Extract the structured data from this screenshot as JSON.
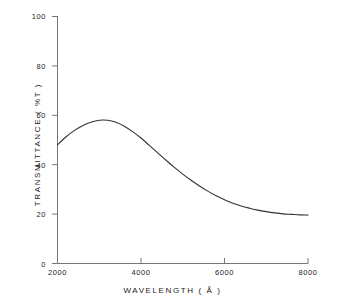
{
  "chart_data": {
    "type": "line",
    "title": "",
    "subtitle": "",
    "xlabel": "WAVELENGTH  ( Å )",
    "ylabel": "TRANSMITTANCE ( %T )",
    "xlim": [
      2000,
      8000
    ],
    "ylim": [
      0,
      100
    ],
    "grid": false,
    "legend": null,
    "xticks": [
      2000,
      4000,
      6000,
      8000
    ],
    "xtick_labels": [
      "2000",
      "4000",
      "6000",
      "8000"
    ],
    "yticks": [
      0,
      20,
      40,
      60,
      80,
      100
    ],
    "ytick_labels": [
      "0",
      "20",
      "40",
      "60",
      "80",
      "100"
    ],
    "series": [
      {
        "name": "transmittance",
        "color": "#333333",
        "x": [
          2000,
          2200,
          2400,
          2600,
          2800,
          3000,
          3200,
          3400,
          3600,
          3800,
          4000,
          4200,
          4400,
          4600,
          4800,
          5000,
          5200,
          5400,
          5600,
          5800,
          6000,
          6200,
          6400,
          6600,
          6800,
          7000,
          7200,
          7400,
          7600,
          7800,
          8000
        ],
        "y": [
          48.0,
          51.2,
          53.8,
          55.8,
          57.2,
          58.0,
          58.0,
          57.2,
          55.6,
          53.4,
          50.8,
          47.8,
          44.8,
          41.8,
          38.9,
          36.2,
          33.7,
          31.4,
          29.3,
          27.4,
          25.8,
          24.4,
          23.3,
          22.4,
          21.6,
          21.0,
          20.5,
          20.1,
          19.9,
          19.7,
          19.6
        ]
      }
    ],
    "annotations": []
  },
  "axes": {
    "x_title": "WAVELENGTH  ( Å )",
    "y_title": "TRANSMITTANCE ( %T )"
  },
  "colors": {
    "background": "#ffffff",
    "axis": "#555555",
    "curve": "#333333",
    "text": "#1a1a1a"
  }
}
